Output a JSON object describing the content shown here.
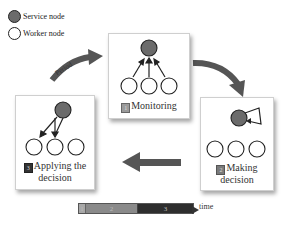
{
  "legend": {
    "items": [
      {
        "label": "Service node",
        "type": "service",
        "color": "#6b6b6b"
      },
      {
        "label": "Worker node",
        "type": "worker",
        "color": "#ffffff"
      }
    ]
  },
  "arrows": {
    "period_label": "Period"
  },
  "stages": [
    {
      "id": "monitoring",
      "number": "1",
      "label_line1": "Monitoring",
      "label_line2": "",
      "badge_color": "#9a9a9a"
    },
    {
      "id": "making-decision",
      "number": "2",
      "label_line1": "Making",
      "label_line2": "decision",
      "badge_color": "#7a7a7a"
    },
    {
      "id": "applying-decision",
      "number": "3",
      "label_line1": "Applying the",
      "label_line2": "decision",
      "badge_color": "#333333"
    }
  ],
  "timeline": {
    "segments": [
      {
        "label": "1",
        "color": "#a8a8a8",
        "width": 6
      },
      {
        "label": "2",
        "color": "#8a8a8a",
        "width": 52
      },
      {
        "label": "3",
        "color": "#2e2e2e",
        "width": 56
      }
    ],
    "axis_label": "time"
  }
}
